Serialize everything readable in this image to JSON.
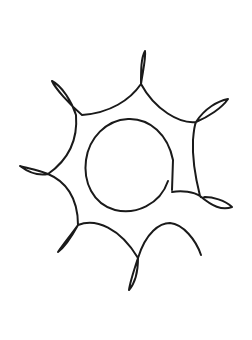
{
  "image": {
    "subject": "sun-doodle",
    "background_color": "#ffffff",
    "stroke_color": "#1a1a1a"
  }
}
